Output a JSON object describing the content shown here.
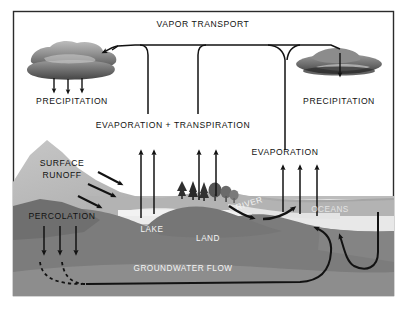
{
  "figure": {
    "frame_color": "#2b2b2b",
    "background_color": "#ffffff"
  },
  "palette": {
    "sky": "#ffffff",
    "mountain_light": "#b9b9b9",
    "ground_mid": "#a8a8a8",
    "subsurface_dark": "#7c7c7c",
    "bedrock": "#909090",
    "water_light": "#ededed",
    "ocean": "#e8e8e8",
    "cloud_dark": "#5d5d5d",
    "cloud_light": "#b0b0b0",
    "line": "#121212",
    "label_dark": "#111111",
    "label_white": "#f4f4f4"
  },
  "labels": {
    "vapor_transport": "VAPOR TRANSPORT",
    "precipitation_left": "PRECIPITATION",
    "precipitation_right": "PRECIPITATION",
    "evaporation_transpiration": "EVAPORATION + TRANSPIRATION",
    "evaporation": "EVAPORATION",
    "surface_runoff_line1": "SURFACE",
    "surface_runoff_line2": "RUNOFF",
    "percolation": "PERCOLATION",
    "lake": "LAKE",
    "river": "RIVER",
    "land": "LAND",
    "oceans": "OCEANS",
    "groundwater_flow": "GROUNDWATER FLOW"
  },
  "icons": {
    "cloud_left": "cloud-icon",
    "cloud_right": "cloud-icon",
    "trees_conifer": "conifer-tree-icon",
    "trees_deciduous": "deciduous-tree-icon",
    "rain_arrow": "down-arrow-icon",
    "evaporation_arrow": "up-arrow-icon",
    "runoff_arrow": "diagonal-arrow-icon",
    "percolation_arrow": "down-arrow-icon",
    "groundwater_arrow": "curved-arrow-icon",
    "vapor_pipe": "pipe-connector-icon"
  },
  "flows": {
    "precipitation_left_arrows": 3,
    "precipitation_right_arrows": 1,
    "lake_evaporation_arrows": 2,
    "tree_transpiration_arrows": 2,
    "ocean_evaporation_arrows": 3,
    "surface_runoff_arrows": 3,
    "percolation_arrows": 3,
    "groundwater_discharge_arrows": 2
  }
}
